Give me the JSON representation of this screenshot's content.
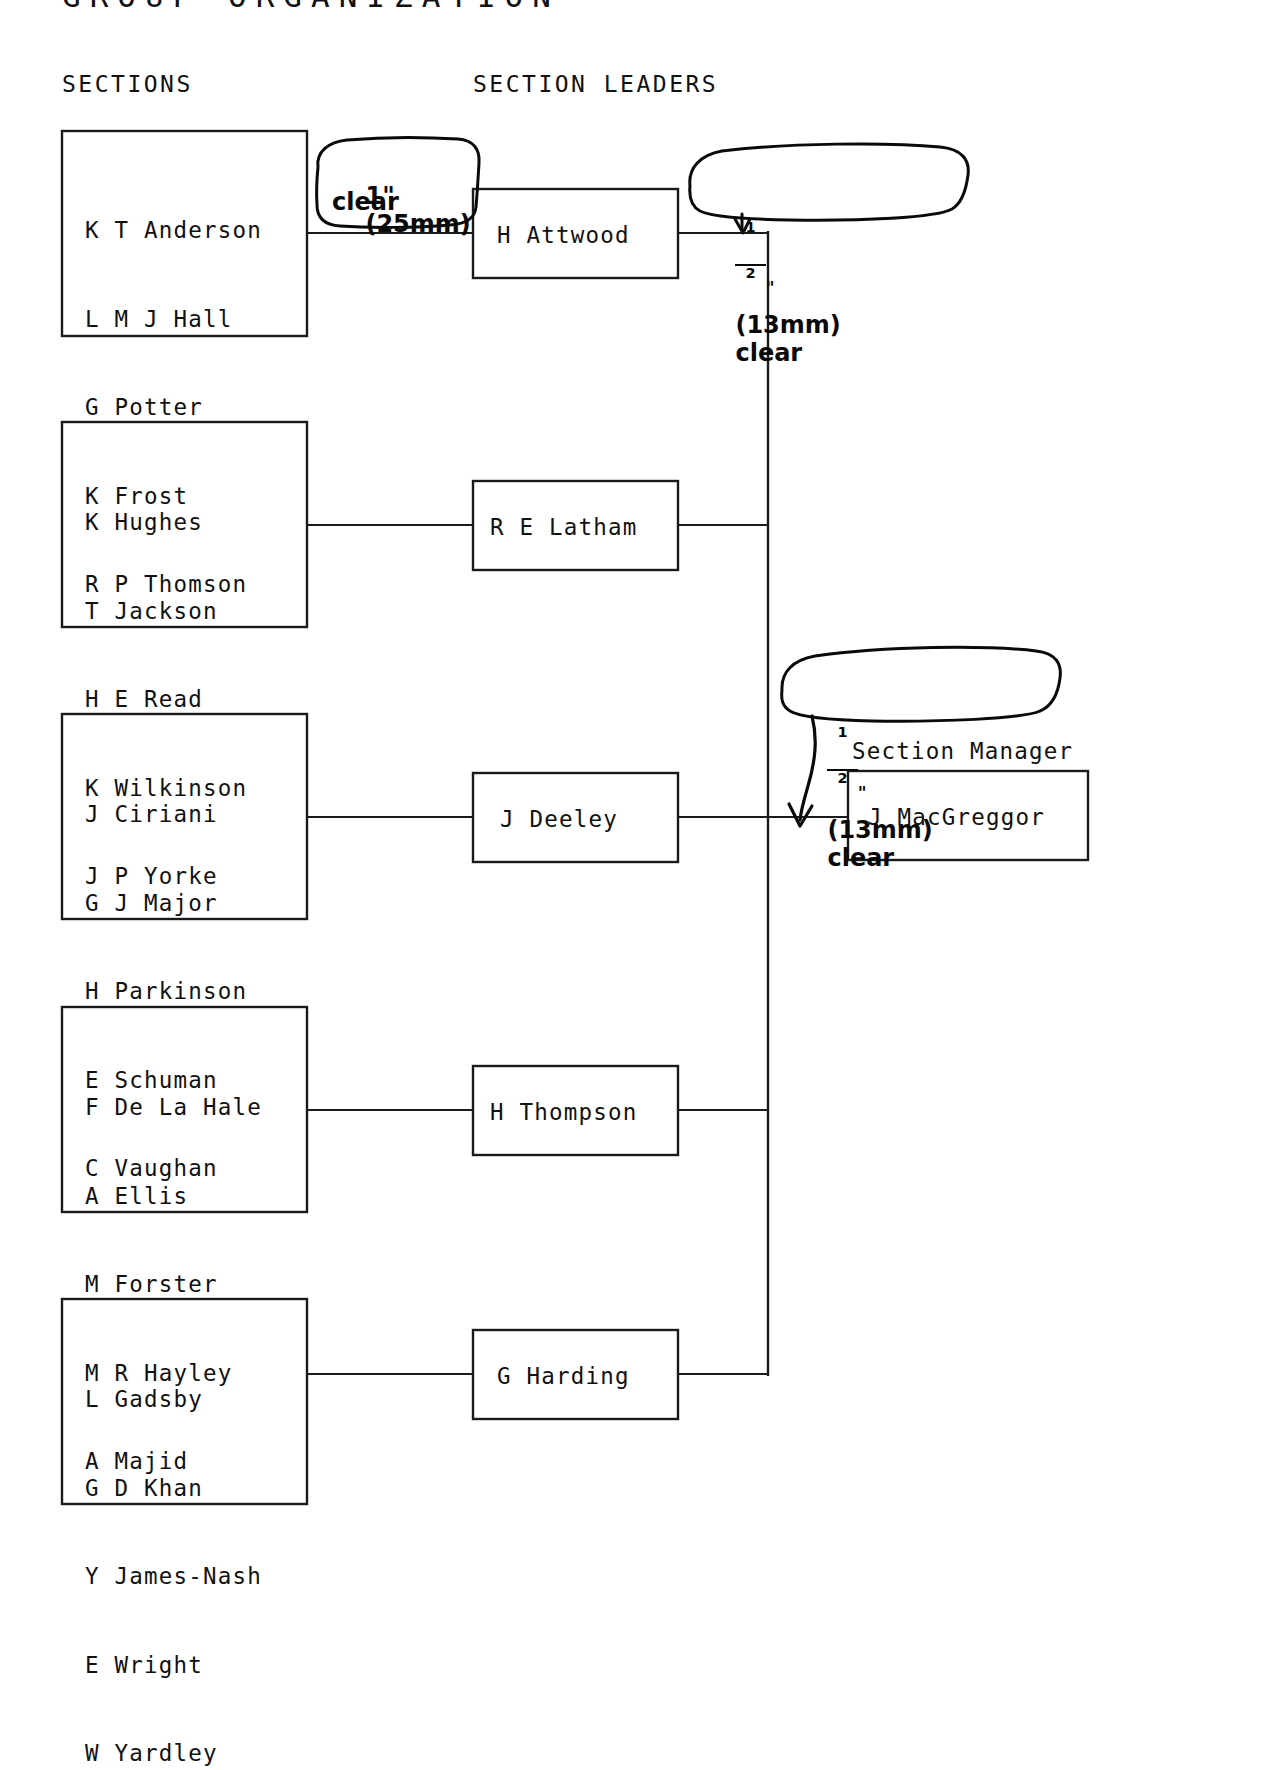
{
  "document": {
    "title": "GROUP ORGANIZATION",
    "column_headers": {
      "sections": "SECTIONS",
      "section_leaders": "SECTION LEADERS",
      "section_manager": "Section Manager"
    }
  },
  "colors": {
    "ink": "#111111",
    "handwriting": "#0a0a0a",
    "paper": "#ffffff",
    "rule": "#1a1a1a"
  },
  "sections": [
    {
      "id": "section-1",
      "members": [
        "K T Anderson",
        "L M J Hall",
        "G Potter",
        "K Frost",
        "R P Thomson"
      ],
      "leader": "H Attwood"
    },
    {
      "id": "section-2",
      "members": [
        "K Hughes",
        "T Jackson",
        "H E Read",
        "K Wilkinson",
        "J P Yorke"
      ],
      "leader": "R E Latham"
    },
    {
      "id": "section-3",
      "members": [
        "J Ciriani",
        "G J Major",
        "H Parkinson",
        "E Schuman",
        "C Vaughan"
      ],
      "leader": "J Deeley"
    },
    {
      "id": "section-4",
      "members": [
        "F De La Hale",
        "A Ellis",
        "M Forster",
        "M R Hayley",
        "A Majid"
      ],
      "leader": "H Thompson"
    },
    {
      "id": "section-5",
      "members": [
        "L Gadsby",
        "G D Khan",
        "Y James-Nash",
        "E Wright",
        "W Yardley"
      ],
      "leader": "G Harding"
    }
  ],
  "manager": {
    "name": "J MacGreggor",
    "title": "Section Manager"
  },
  "annotations": [
    {
      "id": "annotation-1",
      "numerator": "",
      "denominator": "",
      "whole": "1",
      "inch_mark": "\"",
      "metric": "(25mm)",
      "word": "clear",
      "full_text": "1\" (25mm) clear",
      "has_arrow": false
    },
    {
      "id": "annotation-2",
      "numerator": "1",
      "denominator": "2",
      "whole": "",
      "inch_mark": "\"",
      "metric": "(13mm)",
      "word": "clear",
      "full_text": "1/2\" (13mm) clear",
      "has_arrow": true
    },
    {
      "id": "annotation-3",
      "numerator": "1",
      "denominator": "2",
      "whole": "",
      "inch_mark": "\"",
      "metric": "(13mm)",
      "word": "clear",
      "full_text": "1/2\" (13mm) clear",
      "has_arrow": true
    }
  ]
}
